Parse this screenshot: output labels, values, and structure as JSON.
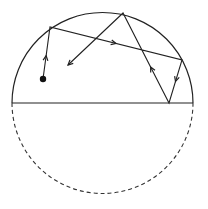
{
  "diagram": {
    "type": "billiard-in-semicircle",
    "colors": {
      "stroke": "#222222",
      "background": "#ffffff"
    },
    "circle": {
      "cx": 102.5,
      "cy": 103,
      "r": 90.5
    },
    "diameter": {
      "x1": 12,
      "y1": 103,
      "x2": 193,
      "y2": 103
    },
    "start_point": {
      "x": 43,
      "y": 79
    },
    "path_points": [
      {
        "x": 43,
        "y": 79
      },
      {
        "x": 50,
        "y": 27
      },
      {
        "x": 182,
        "y": 60
      },
      {
        "x": 169,
        "y": 103
      },
      {
        "x": 123,
        "y": 13
      },
      {
        "x": 68,
        "y": 65
      }
    ],
    "mid_arrows": [
      {
        "segment": 0,
        "t": 0.45
      },
      {
        "segment": 1,
        "t": 0.5
      },
      {
        "segment": 2,
        "t": 0.5
      },
      {
        "segment": 3,
        "t": 0.4
      }
    ],
    "end_arrow": true
  }
}
